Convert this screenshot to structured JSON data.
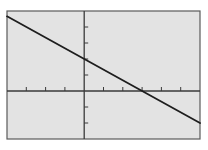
{
  "screen": {
    "background": "#e3e3e3",
    "frame_color": "#5a5a5a",
    "axis_color": "#3a3a3a",
    "line_color": "#1e1e1e"
  },
  "chart_data": {
    "type": "line",
    "title": "",
    "xlabel": "",
    "ylabel": "",
    "xlim": [
      -4,
      6
    ],
    "ylim": [
      -3,
      5
    ],
    "x_tick_step": 1,
    "y_tick_step": 1,
    "grid": false,
    "legend": null,
    "series": [
      {
        "name": "y = -2/3 x + 2",
        "equation": "y = -(2/3)x + 2",
        "slope": -0.6667,
        "intercept": 2,
        "x": [
          -4,
          0,
          3,
          6
        ],
        "y": [
          4.667,
          2,
          0,
          -2
        ]
      }
    ],
    "annotations": {
      "y_intercept": [
        0,
        2
      ],
      "x_intercept": [
        3,
        0
      ]
    }
  }
}
